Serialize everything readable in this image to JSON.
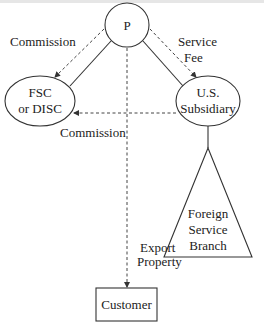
{
  "diagram": {
    "nodes": {
      "parent": {
        "label": "P"
      },
      "fsc_disc": {
        "line1": "FSC",
        "line2": "or DISC"
      },
      "us_subsidiary": {
        "line1": "U.S.",
        "line2": "Subsidiary"
      },
      "foreign_branch": {
        "line1": "Foreign",
        "line2": "Service",
        "line3": "Branch"
      },
      "customer": {
        "label": "Customer"
      }
    },
    "edges": {
      "p_to_fsc": {
        "label": "Commission",
        "style": "dashed-arrow"
      },
      "p_to_sub": {
        "line1": "Service",
        "line2": "Fee",
        "style": "dashed-arrow"
      },
      "sub_to_fsc": {
        "label": "Commission",
        "style": "dashed-arrow"
      },
      "p_to_customer": {
        "line1": "Export",
        "line2": "Property",
        "style": "dashed-arrow"
      },
      "ownership_p_fsc": {
        "style": "solid"
      },
      "ownership_p_sub": {
        "style": "solid"
      },
      "ownership_sub_branch": {
        "style": "solid"
      }
    }
  }
}
